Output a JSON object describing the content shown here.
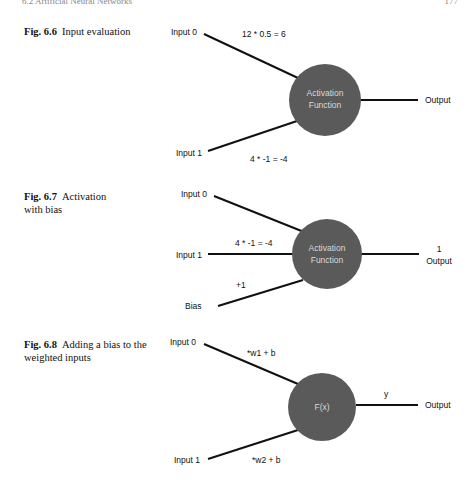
{
  "page": {
    "header_left": "6.2 Artificial Neural Networks",
    "header_right": "177"
  },
  "figures": [
    {
      "number": "Fig. 6.6",
      "caption": "Input evaluation",
      "node_label_line1": "Activation",
      "node_label_line2": "Function",
      "inputs": [
        {
          "label": "Input 0",
          "weight_expr": "12 * 0.5 = 6"
        },
        {
          "label": "Input 1",
          "weight_expr": "4 * -1 = -4"
        }
      ],
      "output_label": "Output",
      "output_value": ""
    },
    {
      "number": "Fig. 6.7",
      "caption": "Activation with bias",
      "node_label_line1": "Activation",
      "node_label_line2": "Function",
      "inputs": [
        {
          "label": "Input 0",
          "weight_expr": ""
        },
        {
          "label": "Input 1",
          "weight_expr": "4 * -1 = -4"
        },
        {
          "label": "Bias",
          "weight_expr": "+1"
        }
      ],
      "output_label": "Output",
      "output_value": "1"
    },
    {
      "number": "Fig. 6.8",
      "caption": "Adding a bias to the weighted inputs",
      "node_label_line1": "F(x)",
      "node_label_line2": "",
      "inputs": [
        {
          "label": "Input 0",
          "weight_expr": "*w1 + b"
        },
        {
          "label": "Input 1",
          "weight_expr": "*w2 + b"
        }
      ],
      "output_label": "Output",
      "output_value": "y"
    }
  ],
  "colors": {
    "node_fill": "#5a5a5a",
    "node_text": "#d9d9d9",
    "line": "#111111"
  }
}
